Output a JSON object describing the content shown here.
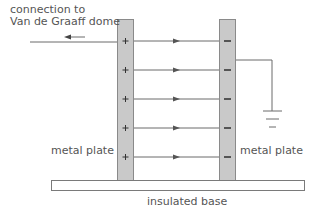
{
  "labels": {
    "connection_line1": "connection to",
    "connection_line2": "Van de Graaff dome",
    "left_plate": "metal plate",
    "right_plate": "metal plate",
    "base": "insulated base"
  },
  "charges": {
    "positive": "+",
    "negative": "−"
  },
  "colors": {
    "plate_fill": "#c9c9c9",
    "plate_border": "#8a8a8a",
    "line": "#6a6a6a",
    "text": "#555555"
  },
  "field_lines_y": [
    41,
    70,
    99,
    128,
    157
  ]
}
